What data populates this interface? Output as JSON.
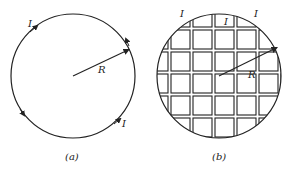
{
  "figure_a": {
    "caption": "(a)",
    "current_labels": [
      "I",
      "I"
    ],
    "radius_label": "R"
  },
  "figure_b": {
    "caption": "(b)",
    "current_labels": [
      "I",
      "I",
      "I"
    ],
    "radius_label": "R"
  },
  "colors": {
    "stroke": "#222222",
    "background": "#ffffff"
  }
}
